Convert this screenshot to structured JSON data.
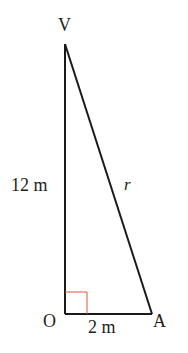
{
  "diagram": {
    "type": "right-triangle",
    "vertices": {
      "top": "V",
      "right_angle": "O",
      "base_end": "A"
    },
    "labels": {
      "vertical_side": "12 m",
      "hypotenuse": "r",
      "base_side": "2 m"
    },
    "colors": {
      "lines": "#1a1a1a",
      "right_angle_marker": "#e0533a",
      "text": "#231f20"
    }
  }
}
